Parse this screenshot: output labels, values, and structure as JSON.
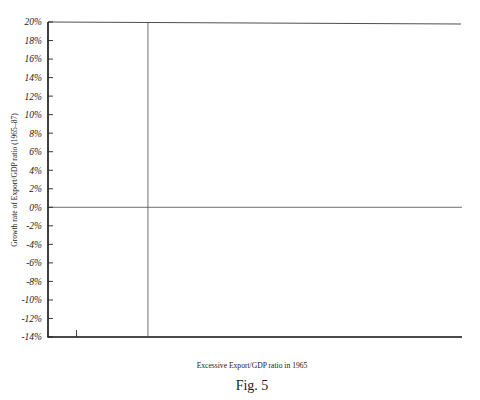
{
  "figure": {
    "caption": "Fig. 5",
    "xlabel": "Excessive Export/GDP ratio in 1965",
    "ylabel": "Growth rate of Export/GDP ratio (1965–87)"
  },
  "chart_data": {
    "type": "scatter",
    "title": "",
    "xlabel": "Excessive Export/GDP ratio in 1965",
    "ylabel": "Growth rate of Export/GDP ratio (1965–87)",
    "xlim": [
      -28,
      88
    ],
    "ylim": [
      -14,
      20
    ],
    "xticks_major": [
      "-20%",
      "0%",
      "20%",
      "40%",
      "60%",
      "80%"
    ],
    "xtick_major_values": [
      -20,
      0,
      20,
      40,
      60,
      80
    ],
    "xtick_minor_values": [
      -10,
      10,
      30,
      50,
      70
    ],
    "yticks": [
      "20%",
      "18%",
      "16%",
      "14%",
      "12%",
      "10%",
      "8%",
      "6%",
      "4%",
      "2%",
      "0%",
      "-2%",
      "-4%",
      "-6%",
      "-8%",
      "-10%",
      "-12%",
      "-14%"
    ],
    "ytick_values": [
      20,
      18,
      16,
      14,
      12,
      10,
      8,
      6,
      4,
      2,
      0,
      -2,
      -4,
      -6,
      -8,
      -10,
      -12,
      -14
    ],
    "grid": false,
    "legend": "none",
    "reference_lines": [
      {
        "orientation": "horizontal",
        "value": 0
      },
      {
        "orientation": "vertical",
        "value": 0
      }
    ],
    "annotations": [
      {
        "label": "Korea",
        "x": -3.5,
        "y": 17.9
      },
      {
        "label": "Taiwan",
        "x": -0.6,
        "y": 9.6
      },
      {
        "label": "Japan",
        "x": -0.3,
        "y": 5.0
      },
      {
        "label": "Hong Kong",
        "x": 50.0,
        "y": 0.9
      },
      {
        "label": "Singapore",
        "x": 75.0,
        "y": -6.0
      }
    ],
    "points": [
      {
        "x": -3.5,
        "y": 17.9,
        "label": "Korea"
      },
      {
        "x": -9.8,
        "y": 12.4
      },
      {
        "x": -0.6,
        "y": 9.6,
        "label": "Taiwan"
      },
      {
        "x": -11.0,
        "y": 8.0
      },
      {
        "x": -3.6,
        "y": 7.7
      },
      {
        "x": -9.4,
        "y": 7.0
      },
      {
        "x": -14.4,
        "y": 6.2
      },
      {
        "x": -10.2,
        "y": 6.3
      },
      {
        "x": -5.0,
        "y": 6.4
      },
      {
        "x": -4.6,
        "y": 5.8
      },
      {
        "x": -0.3,
        "y": 5.0,
        "label": "Japan"
      },
      {
        "x": -11.2,
        "y": 4.2
      },
      {
        "x": -6.0,
        "y": 4.0
      },
      {
        "x": -3.0,
        "y": 4.1
      },
      {
        "x": -2.4,
        "y": 4.0
      },
      {
        "x": 1.4,
        "y": 4.2
      },
      {
        "x": 2.6,
        "y": 4.1
      },
      {
        "x": 6.0,
        "y": 4.0
      },
      {
        "x": 8.4,
        "y": 3.7
      },
      {
        "x": 13.0,
        "y": 4.1
      },
      {
        "x": 14.0,
        "y": 4.3
      },
      {
        "x": 19.5,
        "y": 3.6
      },
      {
        "x": -18.6,
        "y": 2.4
      },
      {
        "x": -17.0,
        "y": 2.7
      },
      {
        "x": -16.0,
        "y": 2.1
      },
      {
        "x": -14.0,
        "y": 2.3
      },
      {
        "x": -11.8,
        "y": 2.1
      },
      {
        "x": -11.2,
        "y": 1.7
      },
      {
        "x": -10.4,
        "y": 2.3
      },
      {
        "x": -8.4,
        "y": 2.5
      },
      {
        "x": -7.0,
        "y": 2.3
      },
      {
        "x": -6.2,
        "y": 1.9
      },
      {
        "x": -5.4,
        "y": 2.6
      },
      {
        "x": -2.0,
        "y": 2.1
      },
      {
        "x": 3.2,
        "y": 2.3
      },
      {
        "x": 5.6,
        "y": 2.8
      },
      {
        "x": 6.6,
        "y": 2.2
      },
      {
        "x": 10.6,
        "y": 2.9
      },
      {
        "x": 16.6,
        "y": 2.4
      },
      {
        "x": 21.0,
        "y": 2.6
      },
      {
        "x": -11.0,
        "y": 0.6
      },
      {
        "x": -10.0,
        "y": 0.4
      },
      {
        "x": -3.6,
        "y": 0.7
      },
      {
        "x": -2.8,
        "y": 0.2
      },
      {
        "x": -1.0,
        "y": 0.5
      },
      {
        "x": -0.2,
        "y": 0.1
      },
      {
        "x": 0.4,
        "y": 0.4
      },
      {
        "x": 3.0,
        "y": 0.8
      },
      {
        "x": 5.0,
        "y": 0.3
      },
      {
        "x": 7.6,
        "y": 0.6
      },
      {
        "x": 8.2,
        "y": 0.2
      },
      {
        "x": 8.8,
        "y": 0.5
      },
      {
        "x": 9.6,
        "y": 0.3
      },
      {
        "x": 22.0,
        "y": 0.7
      },
      {
        "x": 36.0,
        "y": -0.4
      },
      {
        "x": 50.0,
        "y": 0.9,
        "label": "Hong Kong"
      },
      {
        "x": -6.6,
        "y": -1.0
      },
      {
        "x": -4.4,
        "y": -1.4
      },
      {
        "x": -3.4,
        "y": -1.1
      },
      {
        "x": -2.6,
        "y": -1.5
      },
      {
        "x": -1.6,
        "y": -1.9
      },
      {
        "x": -0.8,
        "y": -1.6
      },
      {
        "x": 0.6,
        "y": -1.3
      },
      {
        "x": 1.6,
        "y": -2.0
      },
      {
        "x": 2.4,
        "y": -1.6
      },
      {
        "x": 3.0,
        "y": -1.2
      },
      {
        "x": 3.6,
        "y": -1.9
      },
      {
        "x": 4.2,
        "y": -2.3
      },
      {
        "x": 5.2,
        "y": -1.5
      },
      {
        "x": 7.0,
        "y": -1.4
      },
      {
        "x": 9.4,
        "y": -1.8
      },
      {
        "x": 11.0,
        "y": -2.1
      },
      {
        "x": 25.0,
        "y": -1.2
      },
      {
        "x": -19.2,
        "y": -2.2
      },
      {
        "x": -17.6,
        "y": -2.0
      },
      {
        "x": -8.2,
        "y": -3.0
      },
      {
        "x": -4.0,
        "y": -3.4
      },
      {
        "x": -2.0,
        "y": -3.4
      },
      {
        "x": -5.4,
        "y": -4.2
      },
      {
        "x": -4.0,
        "y": -4.6
      },
      {
        "x": 9.0,
        "y": -3.3
      },
      {
        "x": 10.8,
        "y": -3.5
      },
      {
        "x": 16.0,
        "y": -2.9
      },
      {
        "x": 18.4,
        "y": -3.2
      },
      {
        "x": 8.6,
        "y": -4.4
      },
      {
        "x": 10.0,
        "y": -4.2
      },
      {
        "x": -5.8,
        "y": -5.8
      },
      {
        "x": 7.6,
        "y": -6.1
      },
      {
        "x": 29.0,
        "y": -6.2
      },
      {
        "x": 10.6,
        "y": -7.6
      },
      {
        "x": -4.6,
        "y": -10.2
      },
      {
        "x": 0.0,
        "y": -10.2
      },
      {
        "x": 0.6,
        "y": -11.0
      },
      {
        "x": 4.6,
        "y": -12.9
      },
      {
        "x": 75.0,
        "y": -6.0,
        "label": "Singapore"
      }
    ]
  }
}
